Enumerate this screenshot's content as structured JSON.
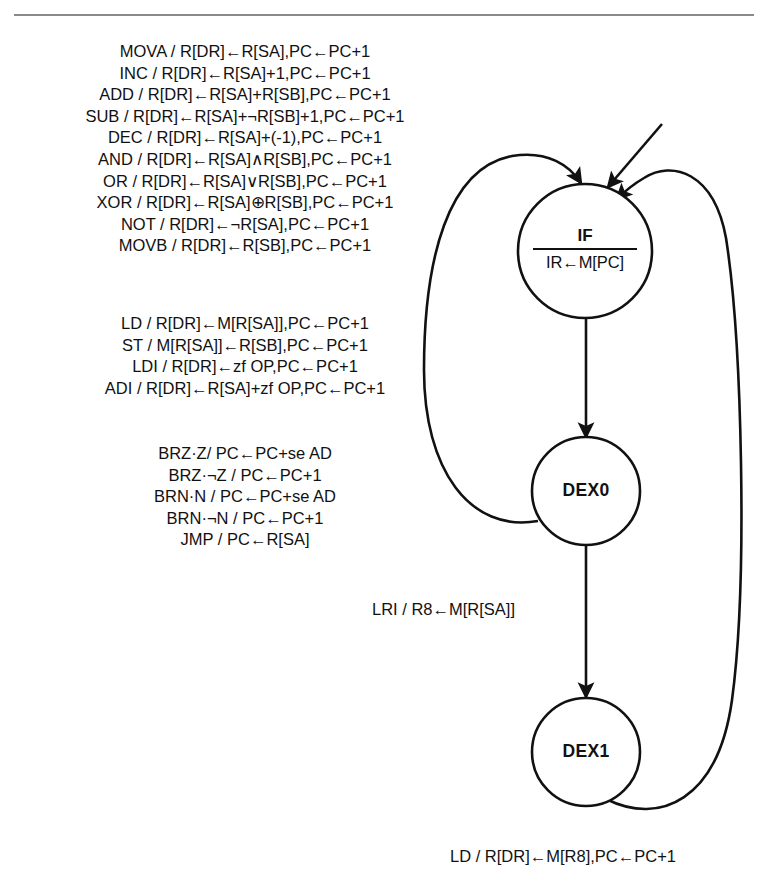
{
  "page": {
    "background": "#ffffff",
    "ink": "#111111",
    "rule_color": "#8a8a8a",
    "corner_mark": ""
  },
  "instruction_blocks": [
    {
      "id": "alu-register-ops",
      "name": "register-and-alu-operations",
      "lines": [
        "MOVA / R[DR]←R[SA],PC←PC+1",
        "INC / R[DR]←R[SA]+1,PC←PC+1",
        "ADD / R[DR]←R[SA]+R[SB],PC←PC+1",
        "SUB / R[DR]←R[SA]+¬R[SB]+1,PC←PC+1",
        "DEC / R[DR]←R[SA]+(-1),PC←PC+1",
        "AND / R[DR]←R[SA]∧R[SB],PC←PC+1",
        "OR / R[DR]←R[SA]∨R[SB],PC←PC+1",
        "XOR / R[DR]←R[SA]⊕R[SB],PC←PC+1",
        "NOT / R[DR]←¬R[SA],PC←PC+1",
        "MOVB / R[DR]←R[SB],PC←PC+1"
      ]
    },
    {
      "id": "memory-immediate-ops",
      "name": "memory-and-immediate-operations",
      "lines": [
        "LD / R[DR]←M[R[SA]],PC←PC+1",
        "ST / M[R[SA]]←R[SB],PC←PC+1",
        "LDI / R[DR]←zf OP,PC←PC+1",
        "ADI / R[DR]←R[SA]+zf OP,PC←PC+1"
      ]
    },
    {
      "id": "branch-jump-ops",
      "name": "branch-and-jump-operations",
      "lines": [
        "BRZ·Z/ PC←PC+se AD",
        "BRZ·¬Z / PC←PC+1",
        "BRN·N / PC←PC+se AD",
        "BRN·¬N / PC←PC+1",
        "JMP / PC←R[SA]"
      ]
    }
  ],
  "states": [
    {
      "id": "IF",
      "name": "instruction-fetch-state",
      "label_top": "IF",
      "label_bottom": "IR←M[PC]",
      "cx": 585,
      "cy": 251,
      "r": 67
    },
    {
      "id": "DEX0",
      "name": "decode-execute-0-state",
      "label_top": "DEX0",
      "label_bottom": "",
      "cx": 586,
      "cy": 491,
      "r": 54
    },
    {
      "id": "DEX1",
      "name": "decode-execute-1-state",
      "label_top": "DEX1",
      "label_bottom": "",
      "cx": 586,
      "cy": 752,
      "r": 54
    }
  ],
  "transitions": [
    {
      "id": "start-to-if",
      "name": "start-arrow-into-if",
      "from": "start",
      "to": "IF",
      "label": ""
    },
    {
      "id": "if-to-dex0",
      "name": "if-to-dex0-edge",
      "from": "IF",
      "to": "DEX0",
      "label": ""
    },
    {
      "id": "dex0-to-if",
      "name": "dex0-back-to-if-edge",
      "from": "DEX0",
      "to": "IF",
      "label": ""
    },
    {
      "id": "dex0-to-dex1",
      "name": "dex0-to-dex1-edge",
      "from": "DEX0",
      "to": "DEX1",
      "label": "LRI / R8←M[R[SA]]"
    },
    {
      "id": "dex1-to-if",
      "name": "dex1-back-to-if-edge",
      "from": "DEX1",
      "to": "IF",
      "label": "LD / R[DR]←M[R8],PC←PC+1"
    }
  ],
  "edge_labels": {
    "lri": "LRI / R8←M[R[SA]]",
    "ld_r8": "LD / R[DR]←M[R8],PC←PC+1"
  },
  "state_labels": {
    "if_top": "IF",
    "if_bottom": "IR←M[PC]",
    "dex0": "DEX0",
    "dex1": "DEX1"
  }
}
